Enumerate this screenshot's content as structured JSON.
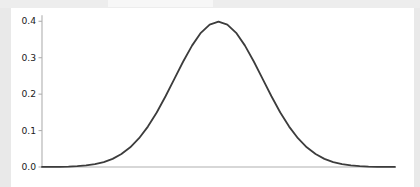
{
  "window": {
    "background_color": "#e9e9e9",
    "figure_background_color": "#ffffff"
  },
  "chart_data": {
    "type": "line",
    "title": "",
    "subtitle": "",
    "xlabel": "",
    "ylabel": "",
    "legend": [],
    "grid": false,
    "legend_position": "none",
    "line_color": "#3c3c3c",
    "line_width": 1.8,
    "axis_color": "#b0b0b0",
    "tick_label_color": "#1a1a1a",
    "spines": {
      "left": true,
      "bottom": true,
      "top": false,
      "right": false
    },
    "ylim": [
      0.0,
      0.42
    ],
    "xlim": [
      -4.0,
      4.0
    ],
    "yticks": [
      0.0,
      0.1,
      0.2,
      0.3,
      0.4
    ],
    "ytick_labels": [
      "0.0",
      "0.1",
      "0.2",
      "0.3",
      "0.4"
    ],
    "xticks": [],
    "xtick_labels": [],
    "series": [
      {
        "name": "standard normal pdf",
        "distribution": "normal",
        "mean": 0.0,
        "std": 1.0,
        "peak_value": 0.3989,
        "x": [
          -4.0,
          -3.8,
          -3.6,
          -3.4,
          -3.2,
          -3.0,
          -2.8,
          -2.6,
          -2.4,
          -2.2,
          -2.0,
          -1.8,
          -1.6,
          -1.4,
          -1.2,
          -1.0,
          -0.8,
          -0.6,
          -0.4,
          -0.2,
          0.0,
          0.2,
          0.4,
          0.6,
          0.8,
          1.0,
          1.2,
          1.4,
          1.6,
          1.8,
          2.0,
          2.2,
          2.4,
          2.6,
          2.8,
          3.0,
          3.2,
          3.4,
          3.6,
          3.8,
          4.0
        ],
        "y": [
          0.0001,
          0.0003,
          0.0006,
          0.0012,
          0.0024,
          0.0044,
          0.0079,
          0.0136,
          0.0224,
          0.0355,
          0.054,
          0.079,
          0.1109,
          0.1497,
          0.1942,
          0.242,
          0.2897,
          0.3332,
          0.3683,
          0.391,
          0.3989,
          0.391,
          0.3683,
          0.3332,
          0.2897,
          0.242,
          0.1942,
          0.1497,
          0.1109,
          0.079,
          0.054,
          0.0355,
          0.0224,
          0.0136,
          0.0079,
          0.0044,
          0.0024,
          0.0012,
          0.0006,
          0.0003,
          0.0001
        ]
      }
    ]
  }
}
